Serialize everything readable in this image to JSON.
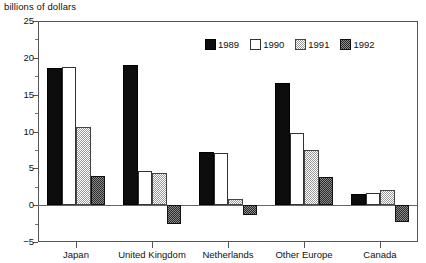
{
  "chart_data": {
    "type": "bar",
    "title": "billions of dollars",
    "xlabel": "",
    "ylabel": "",
    "ylim": [
      -5,
      25
    ],
    "yticks": [
      -5,
      0,
      5,
      10,
      15,
      20,
      25
    ],
    "ytick_labels": [
      "−5",
      "0",
      "5",
      "10",
      "15",
      "20",
      "25"
    ],
    "minor_tick_step": 2.5,
    "grid": false,
    "legend_position": "top-right-inside",
    "categories": [
      "Japan",
      "United Kingdom",
      "Netherlands",
      "Other Europe",
      "Canada"
    ],
    "series": [
      {
        "name": "1989",
        "color": "#0d0d0d",
        "values": [
          18.6,
          19.0,
          7.2,
          16.6,
          1.5
        ]
      },
      {
        "name": "1990",
        "color": "#ffffff",
        "values": [
          18.8,
          4.6,
          7.1,
          9.8,
          1.6
        ]
      },
      {
        "name": "1991",
        "color": "#c0c0c0",
        "values": [
          10.6,
          4.4,
          0.9,
          7.5,
          2.1
        ]
      },
      {
        "name": "1992",
        "color": "#5a5a5a",
        "values": [
          3.9,
          -2.6,
          -1.4,
          3.8,
          -2.3
        ]
      }
    ]
  },
  "axis": {
    "zero_line_value": 0
  }
}
